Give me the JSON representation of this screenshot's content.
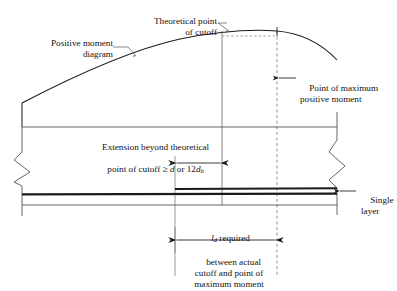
{
  "diagram": {
    "type": "structural-detail",
    "labels": {
      "positive_moment_diagram": "Positive moment\ndiagram",
      "theoretical_point_of_cutoff": "Theoretical point\nof cutoff",
      "point_of_maximum_positive_moment": "Point of maximum\npositive moment",
      "extension_line1": "Extension beyond theoretical",
      "extension_line2_pre": "point of cutoff ",
      "extension_line2_ge": "≥ ",
      "extension_line2_d": "d",
      "extension_line2_or": " or 12",
      "extension_line2_db": "d",
      "extension_line2_db_sub": "b",
      "single_layer": "Single\nlayer",
      "ld_required_italic": "l",
      "ld_required_sub": "d",
      "ld_required_rest": " required",
      "ld_note": "between actual\ncutoff and point of\nmaximum moment"
    },
    "geometry": {
      "theoretical_cutoff_x": 222,
      "max_moment_x": 277,
      "actual_cutoff_x": 175,
      "beam_top_y": 127,
      "beam_bottom_y": 205,
      "rebar_y": 194,
      "curve_peak_y": 32
    },
    "colors": {
      "line": "#1a1a1a",
      "thin_line": "#555555",
      "dashed_line": "#777777",
      "background": "#ffffff"
    }
  }
}
